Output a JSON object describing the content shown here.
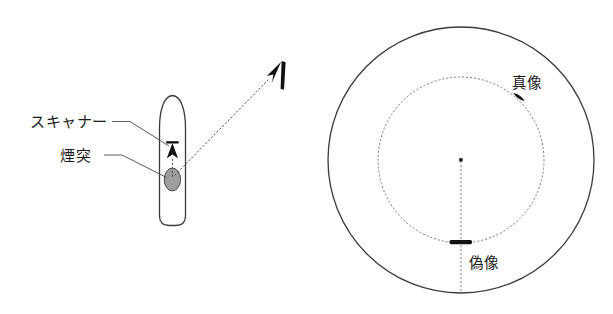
{
  "figure": {
    "title": "",
    "background_color": "#ffffff",
    "line_color": "#3b3b3b",
    "accent_gray": "#9e9e9e",
    "blip_color": "#111111"
  },
  "left_panel": {
    "name": "ship-plan-view",
    "labels": {
      "scanner": "スキャナー",
      "funnel": "煙突"
    },
    "parts": {
      "hull_name": "ship-hull",
      "scanner_name": "scanner-marker",
      "funnel_name": "funnel-ellipse",
      "target_name": "target-echo-marker",
      "beam_name": "reflected-beam-path"
    }
  },
  "right_panel": {
    "name": "ppi-radar-display",
    "labels": {
      "true_echo": "真像",
      "false_echo": "偽像"
    },
    "geometry": {
      "center_x": 461,
      "center_y": 160,
      "outer_radius": 133,
      "inner_radius": 83
    }
  }
}
